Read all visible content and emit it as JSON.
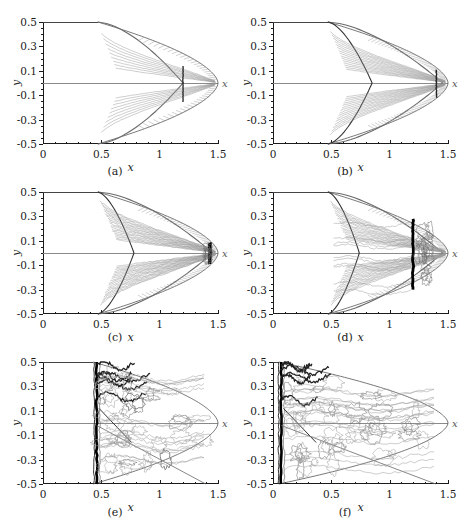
{
  "figure": {
    "faint_header_text": "",
    "panel_count": 6,
    "rows": 3,
    "cols": 2
  },
  "axes": {
    "x_label": "x",
    "y_label": "y",
    "x_ticks": [
      "0",
      "0.5",
      "1",
      "1.5"
    ],
    "x_tick_values": [
      0,
      0.5,
      1,
      1.5
    ],
    "y_ticks": [
      "0.5",
      "0.3",
      "0.1",
      "-0.1",
      "-0.3",
      "-0.5"
    ],
    "y_tick_values": [
      0.5,
      0.3,
      0.1,
      -0.1,
      -0.3,
      -0.5
    ],
    "x_minor_count": 15,
    "y_minor_count": 20,
    "xlim": [
      0,
      1.5
    ],
    "ylim": [
      -0.5,
      0.5
    ]
  },
  "colors": {
    "axis": "#1a1a1a",
    "centerline": "#8a8a8a",
    "contour_light": "#9a9a9a",
    "contour_mid": "#6a6a6a",
    "shock_dark": "#111111",
    "background": "#ffffff"
  },
  "chart_data": {
    "type": "line",
    "title": "",
    "xlabel": "x",
    "ylabel": "y",
    "xlim": [
      0,
      1.5
    ],
    "ylim": [
      -0.5,
      0.5
    ],
    "grid": false,
    "legend": "none",
    "panels": [
      {
        "label": "(a)",
        "index": 0,
        "body_nose_x": 1.5,
        "body_shoulder_x": 0.47,
        "shock_stand_x": 1.2,
        "shock_type": "attached-oblique",
        "contour_density": "low",
        "notes": "Two lobed expansion fans above and below the centerline; sharp near-vertical internal shock at x~1.20 meeting the axis; smooth outer body contour closing at x=1.5."
      },
      {
        "label": "(b)",
        "index": 1,
        "body_nose_x": 1.5,
        "body_shoulder_x": 0.47,
        "shock_stand_x": 1.4,
        "shock_type": "converging-oblique",
        "contour_density": "medium",
        "notes": "Inner oblique shocks cross the axis near x=0.85 and converge to a focus at x~1.42; dense striation band along the upper and lower outer edges."
      },
      {
        "label": "(c)",
        "index": 2,
        "body_nose_x": 1.5,
        "body_shoulder_x": 0.47,
        "shock_stand_x": 1.43,
        "shock_type": "focused-mach-disk",
        "contour_density": "medium-high",
        "notes": "Crossing point moved upstream to x~0.78; a compact, very dark focused region at x~1.43 on the axis; fine contour striations fill the wedge."
      },
      {
        "label": "(d)",
        "index": 3,
        "body_nose_x": 1.5,
        "body_shoulder_x": 0.47,
        "shock_stand_x": 1.2,
        "shock_type": "mach-disk",
        "contour_density": "high",
        "notes": "Strong near-vertical dark Mach disk at x~1.20 spanning y from -0.3 to +0.28; turbulent contour cells downstream of the disk."
      },
      {
        "label": "(e)",
        "index": 4,
        "body_nose_x": 1.5,
        "body_shoulder_x": 0.43,
        "shock_stand_x": 0.46,
        "shock_type": "detached-bow-shock",
        "contour_density": "very-high",
        "notes": "Bow shock collapsed back to x~0.46; broad turbulent contour field filling the entire body region out to x=1.5."
      },
      {
        "label": "(f)",
        "index": 5,
        "body_nose_x": 1.5,
        "body_shoulder_x": 0.05,
        "shock_stand_x": 0.07,
        "shock_type": "detached-bow-shock",
        "contour_density": "very-high",
        "notes": "Shock pressed against the inflow boundary at x~0.07; fully developed turbulent contour structure spanning the whole domain."
      }
    ]
  }
}
